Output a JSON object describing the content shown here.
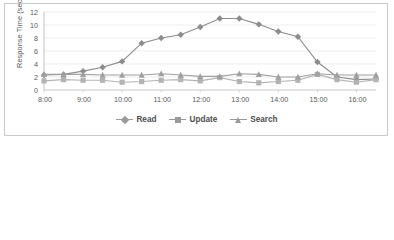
{
  "chart_data": {
    "type": "line",
    "title": "",
    "xlabel": "",
    "ylabel": "Response Time (sec)",
    "ylim": [
      0,
      12
    ],
    "ytick_values": [
      0,
      2,
      4,
      6,
      8,
      10,
      12
    ],
    "xtick_labels": [
      "8:00",
      "9:00",
      "10:00",
      "11:00",
      "12:00",
      "13:00",
      "14:00",
      "15:00",
      "16:00"
    ],
    "x": [
      "8:00",
      "8:30",
      "9:00",
      "9:30",
      "10:00",
      "10:30",
      "11:00",
      "11:30",
      "12:00",
      "12:30",
      "13:00",
      "13:30",
      "14:00",
      "14:30",
      "15:00",
      "15:30",
      "16:00",
      "16:30"
    ],
    "grid": true,
    "legend_position": "bottom",
    "series": [
      {
        "name": "Read",
        "marker": "diamond",
        "color": "#8c8c8c",
        "values": [
          2.3,
          2.4,
          2.9,
          3.5,
          4.4,
          7.2,
          8.0,
          8.5,
          9.7,
          11.0,
          11.0,
          10.1,
          9.0,
          8.2,
          4.3,
          2.0,
          1.6,
          1.7
        ]
      },
      {
        "name": "Update",
        "marker": "square",
        "color": "#b3b3b3",
        "values": [
          1.4,
          1.6,
          1.5,
          1.5,
          1.2,
          1.3,
          1.5,
          1.6,
          1.4,
          1.9,
          1.3,
          1.1,
          1.3,
          1.5,
          2.4,
          1.6,
          1.2,
          1.6
        ]
      },
      {
        "name": "Search",
        "marker": "triangle",
        "color": "#a0a0a0",
        "values": [
          2.4,
          2.4,
          2.4,
          2.3,
          2.3,
          2.3,
          2.5,
          2.3,
          2.1,
          2.1,
          2.5,
          2.4,
          2.0,
          2.0,
          2.5,
          2.3,
          2.3,
          2.3
        ]
      }
    ]
  },
  "legend": {
    "items": [
      {
        "label": "Read"
      },
      {
        "label": "Update"
      },
      {
        "label": "Search"
      }
    ]
  },
  "colors": {
    "border": "#c8c8c8",
    "grid": "#e6e6e6",
    "axis_text": "#58595b",
    "plot_background": "#ffffff"
  }
}
